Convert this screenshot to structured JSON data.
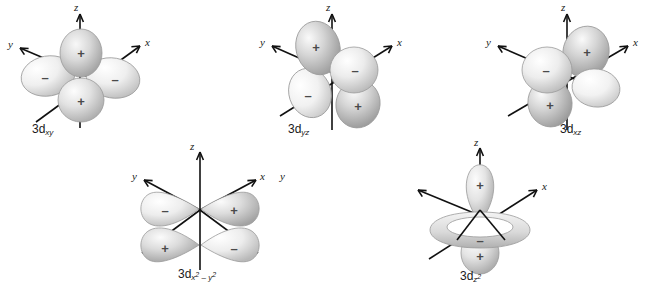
{
  "figure": {
    "background_color": "#ffffff",
    "axis_color": "#111111",
    "lobe_outline_color": "#9a9a9a",
    "lobe_fill_light": "#f4f4f4",
    "lobe_fill_mid": "#cfcfcf",
    "lobe_fill_dark": "#9d9d9d",
    "sign_color": "#4a4a4a"
  },
  "axis_names": {
    "x": "x",
    "y": "y",
    "z": "z"
  },
  "signs": {
    "positive": "+",
    "negative": "–"
  },
  "orbitals": [
    {
      "id": "3dxy",
      "label_main": "3d",
      "label_sub": "xy",
      "axes": [
        "z",
        "y",
        "x"
      ],
      "lobe_signs": [
        "+",
        "–",
        "–",
        "+"
      ],
      "lobe_count": 4,
      "plane": "xy",
      "description": "four lobes between the x and y axes"
    },
    {
      "id": "3dyz",
      "label_main": "3d",
      "label_sub": "yz",
      "axes": [
        "z",
        "y",
        "x"
      ],
      "lobe_signs": [
        "+",
        "–",
        "–",
        "+"
      ],
      "lobe_count": 4,
      "plane": "yz",
      "description": "four lobes between the y and z axes"
    },
    {
      "id": "3dxz",
      "label_main": "3d",
      "label_sub": "xz",
      "axes": [
        "z",
        "y",
        "x"
      ],
      "lobe_signs": [
        "+",
        "–",
        "+",
        "–"
      ],
      "lobe_count": 4,
      "plane": "xz",
      "description": "four lobes between the x and z axes"
    },
    {
      "id": "3dx2-y2",
      "label_main": "3d",
      "label_sub_x": "x",
      "label_sup_x": "2",
      "label_minus": " – ",
      "label_sub_y": "y",
      "label_sup_y": "2",
      "axes": [
        "z",
        "y",
        "x",
        "y"
      ],
      "lobe_signs": [
        "–",
        "+",
        "+",
        "–"
      ],
      "lobe_count": 4,
      "plane": "xy",
      "description": "four lobes along the x and y axes"
    },
    {
      "id": "3dz2",
      "label_main": "3d",
      "label_sub_z": "z",
      "label_sup_z": "2",
      "axes": [
        "z",
        "x"
      ],
      "lobe_signs": [
        "+",
        "–",
        "+"
      ],
      "lobe_count": 2,
      "has_torus": true,
      "torus_sign": "–",
      "plane": "z",
      "description": "two lobes along z with a negative torus in the xy plane"
    }
  ]
}
